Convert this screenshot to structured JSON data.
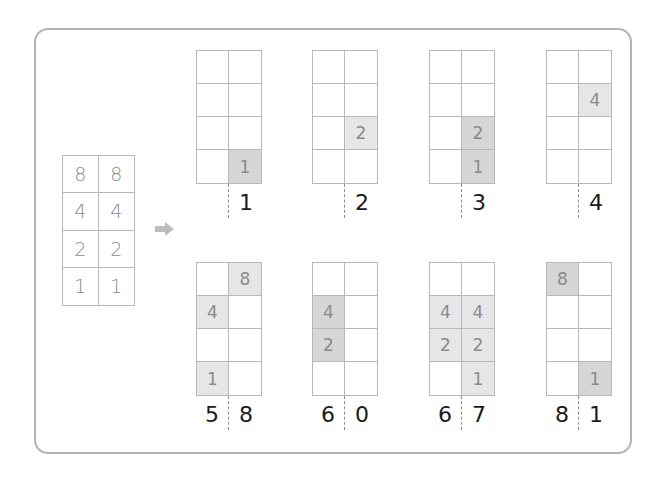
{
  "colors": {
    "frame_border": "#b4b4b4",
    "grid_line": "#b8b8b8",
    "chip_light": "#e6e6e6",
    "chip_dark": "#d6d6d6",
    "chip_text": "#8a8a8a",
    "label_text": "#1a1a1a",
    "arrow": "#bdbdbd"
  },
  "reference_grid": {
    "rows": [
      [
        "8",
        "8"
      ],
      [
        "4",
        "4"
      ],
      [
        "2",
        "2"
      ],
      [
        "1",
        "1"
      ]
    ]
  },
  "arrow_icon": "right-arrow",
  "panels": [
    {
      "cells": [
        [
          "",
          ""
        ],
        [
          "",
          ""
        ],
        [
          "",
          ""
        ],
        [
          "",
          "1"
        ]
      ],
      "shade": [
        [
          "",
          ""
        ],
        [
          "",
          ""
        ],
        [
          "",
          ""
        ],
        [
          "",
          "dark"
        ]
      ],
      "tens": "",
      "ones": "1"
    },
    {
      "cells": [
        [
          "",
          ""
        ],
        [
          "",
          ""
        ],
        [
          "",
          "2"
        ],
        [
          "",
          ""
        ]
      ],
      "shade": [
        [
          "",
          ""
        ],
        [
          "",
          ""
        ],
        [
          "",
          "light"
        ],
        [
          "",
          ""
        ]
      ],
      "tens": "",
      "ones": "2"
    },
    {
      "cells": [
        [
          "",
          ""
        ],
        [
          "",
          ""
        ],
        [
          "",
          "2"
        ],
        [
          "",
          "1"
        ]
      ],
      "shade": [
        [
          "",
          ""
        ],
        [
          "",
          ""
        ],
        [
          "",
          "dark"
        ],
        [
          "",
          "dark"
        ]
      ],
      "tens": "",
      "ones": "3"
    },
    {
      "cells": [
        [
          "",
          ""
        ],
        [
          "",
          "4"
        ],
        [
          "",
          ""
        ],
        [
          "",
          ""
        ]
      ],
      "shade": [
        [
          "",
          ""
        ],
        [
          "",
          "light"
        ],
        [
          "",
          ""
        ],
        [
          "",
          ""
        ]
      ],
      "tens": "",
      "ones": "4"
    },
    {
      "cells": [
        [
          "",
          "8"
        ],
        [
          "4",
          ""
        ],
        [
          "",
          ""
        ],
        [
          "1",
          ""
        ]
      ],
      "shade": [
        [
          "",
          "light"
        ],
        [
          "light",
          ""
        ],
        [
          "",
          ""
        ],
        [
          "light",
          ""
        ]
      ],
      "tens": "5",
      "ones": "8"
    },
    {
      "cells": [
        [
          "",
          ""
        ],
        [
          "4",
          ""
        ],
        [
          "2",
          ""
        ],
        [
          "",
          ""
        ]
      ],
      "shade": [
        [
          "",
          ""
        ],
        [
          "dark",
          ""
        ],
        [
          "dark",
          ""
        ],
        [
          "",
          ""
        ]
      ],
      "tens": "6",
      "ones": "0"
    },
    {
      "cells": [
        [
          "",
          ""
        ],
        [
          "4",
          "4"
        ],
        [
          "2",
          "2"
        ],
        [
          "",
          "1"
        ]
      ],
      "shade": [
        [
          "",
          ""
        ],
        [
          "light",
          "light"
        ],
        [
          "light",
          "light"
        ],
        [
          "",
          "light"
        ]
      ],
      "tens": "6",
      "ones": "7"
    },
    {
      "cells": [
        [
          "8",
          ""
        ],
        [
          "",
          ""
        ],
        [
          "",
          ""
        ],
        [
          "",
          "1"
        ]
      ],
      "shade": [
        [
          "dark",
          ""
        ],
        [
          "",
          ""
        ],
        [
          "",
          ""
        ],
        [
          "",
          "dark"
        ]
      ],
      "tens": "8",
      "ones": "1"
    }
  ]
}
